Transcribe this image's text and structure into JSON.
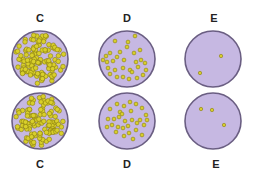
{
  "colors": {
    "dish_fill": "#c6b8e2",
    "dish_border": "#6a5e82",
    "colony_fill": "#d8cf2a",
    "colony_stroke": "#8a7d10",
    "label": "#222222"
  },
  "rows": [
    {
      "name": "top-row",
      "label_y": 12,
      "dishes": [
        {
          "label": "C",
          "cx": 40,
          "cy": 59,
          "r": 28,
          "density": "confluent",
          "colony_count": 120
        },
        {
          "label": "D",
          "cx": 127,
          "cy": 59,
          "r": 28,
          "density": "moderate",
          "colony_count": 30
        },
        {
          "label": "E",
          "cx": 213,
          "cy": 59,
          "r": 28,
          "density": "sparse",
          "colony_count": 2
        }
      ]
    },
    {
      "name": "bottom-row",
      "label_y": 158,
      "dishes": [
        {
          "label": "C",
          "cx": 40,
          "cy": 121,
          "r": 28,
          "density": "confluent",
          "colony_count": 120
        },
        {
          "label": "D",
          "cx": 127,
          "cy": 121,
          "r": 28,
          "density": "moderate",
          "colony_count": 30
        },
        {
          "label": "E",
          "cx": 213,
          "cy": 121,
          "r": 28,
          "density": "sparse",
          "colony_count": 3
        }
      ]
    }
  ],
  "labels": {
    "top_c": "C",
    "top_d": "D",
    "top_e": "E",
    "bottom_c": "C",
    "bottom_d": "D",
    "bottom_e": "E"
  },
  "sparse_colonies": {
    "top_e": [
      [
        221,
        56
      ],
      [
        200,
        73
      ]
    ],
    "bottom_e": [
      [
        201,
        109
      ],
      [
        212,
        110
      ],
      [
        224,
        125
      ]
    ]
  },
  "moderate_colonies": {
    "top_d": [
      [
        115,
        41
      ],
      [
        128,
        42
      ],
      [
        135,
        36
      ],
      [
        127,
        47
      ],
      [
        120,
        52
      ],
      [
        110,
        53
      ],
      [
        106,
        56
      ],
      [
        117,
        57
      ],
      [
        124,
        60
      ],
      [
        134,
        53
      ],
      [
        140,
        50
      ],
      [
        113,
        61
      ],
      [
        107,
        62
      ],
      [
        136,
        62
      ],
      [
        141,
        60
      ],
      [
        145,
        63
      ],
      [
        123,
        68
      ],
      [
        130,
        70
      ],
      [
        115,
        70
      ],
      [
        108,
        68
      ],
      [
        146,
        70
      ],
      [
        117,
        77
      ],
      [
        123,
        77
      ],
      [
        132,
        72
      ],
      [
        137,
        78
      ],
      [
        143,
        75
      ],
      [
        110,
        74
      ],
      [
        129,
        79
      ],
      [
        138,
        67
      ],
      [
        103,
        60
      ]
    ],
    "bottom_d": [
      [
        117,
        104
      ],
      [
        124,
        106
      ],
      [
        130,
        102
      ],
      [
        136,
        104
      ],
      [
        142,
        108
      ],
      [
        110,
        109
      ],
      [
        120,
        112
      ],
      [
        131,
        111
      ],
      [
        146,
        115
      ],
      [
        140,
        120
      ],
      [
        108,
        119
      ],
      [
        114,
        119
      ],
      [
        119,
        117
      ],
      [
        125,
        121
      ],
      [
        132,
        120
      ],
      [
        112,
        125
      ],
      [
        118,
        127
      ],
      [
        123,
        128
      ],
      [
        128,
        126
      ],
      [
        137,
        123
      ],
      [
        144,
        125
      ],
      [
        107,
        127
      ],
      [
        116,
        132
      ],
      [
        124,
        136
      ],
      [
        129,
        133
      ],
      [
        136,
        130
      ],
      [
        147,
        120
      ],
      [
        142,
        135
      ],
      [
        122,
        114
      ],
      [
        133,
        139
      ]
    ]
  }
}
